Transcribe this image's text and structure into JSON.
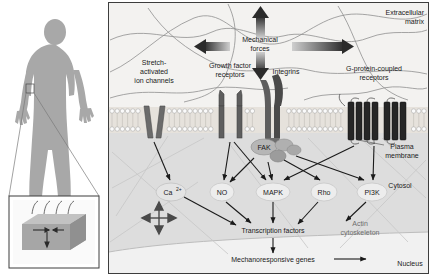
{
  "figure": {
    "panels": {
      "left": {
        "name": "human-body-panel",
        "body_figure_label": "human-silhouette",
        "inset_label": "tissue-block-inset"
      },
      "right": {
        "name": "cell-signalling-panel"
      }
    }
  },
  "compartments": [
    {
      "id": "extracellular",
      "label": "Extracellular\nmatrix",
      "line1": "Extracellular",
      "line2": "matrix",
      "color": "#f2f2f2"
    },
    {
      "id": "membrane",
      "label": "Plasma\nmembrane",
      "line1": "Plasma",
      "line2": "membrane",
      "color": "#e8e5e0"
    },
    {
      "id": "cytosol",
      "label": "Cytosol",
      "line1": "Cytosol",
      "line2": "",
      "color": "#dedede"
    },
    {
      "id": "nucleus",
      "label": "Nucleus",
      "line1": "Nucleus",
      "line2": "",
      "color": "#efefef"
    }
  ],
  "forces": {
    "label_line1": "Mechanical",
    "label_line2": "forces",
    "arrow_directions": [
      "up",
      "down",
      "left",
      "right"
    ]
  },
  "receptors": [
    {
      "id": "stretch-activated-ion-channels",
      "line1": "Stretch-",
      "line2": "activated",
      "line3": "ion channels"
    },
    {
      "id": "growth-factor-receptors",
      "line1": "Growth factor",
      "line2": "receptors",
      "line3": ""
    },
    {
      "id": "integrins",
      "line1": "Integrins",
      "line2": "",
      "line3": ""
    },
    {
      "id": "g-protein-coupled-receptors",
      "line1": "G-protein-coupled",
      "line2": "receptors",
      "line3": ""
    }
  ],
  "nodes": [
    {
      "id": "fak",
      "label": "FAK",
      "shape": "blob",
      "style": "membrane-complex"
    },
    {
      "id": "calcium",
      "label": "Ca",
      "sup": "2+",
      "shape": "ellipse"
    },
    {
      "id": "no",
      "label": "NO",
      "shape": "ellipse"
    },
    {
      "id": "mapk",
      "label": "MAPK",
      "shape": "ellipse"
    },
    {
      "id": "rho",
      "label": "Rho",
      "shape": "ellipse"
    },
    {
      "id": "pi3k",
      "label": "PI3K",
      "shape": "ellipse"
    },
    {
      "id": "transcription-factors",
      "label": "Transcription factors",
      "shape": "text"
    },
    {
      "id": "mechanoresponsive-genes",
      "label": "Mechanoresponsive genes",
      "shape": "text"
    },
    {
      "id": "actin-cytoskeleton",
      "line1": "Actin",
      "line2": "cytoskeleton",
      "shape": "text-gray"
    }
  ],
  "edges": [
    {
      "from": "stretch-activated-ion-channels",
      "to": "calcium"
    },
    {
      "from": "growth-factor-receptors",
      "to": "no"
    },
    {
      "from": "growth-factor-receptors",
      "to": "mapk"
    },
    {
      "from": "fak",
      "to": "no"
    },
    {
      "from": "fak",
      "to": "mapk"
    },
    {
      "from": "fak",
      "to": "rho"
    },
    {
      "from": "fak",
      "to": "pi3k"
    },
    {
      "from": "g-protein-coupled-receptors",
      "to": "mapk"
    },
    {
      "from": "g-protein-coupled-receptors",
      "to": "pi3k"
    },
    {
      "from": "calcium",
      "to": "transcription-factors"
    },
    {
      "from": "no",
      "to": "transcription-factors"
    },
    {
      "from": "mapk",
      "to": "transcription-factors"
    },
    {
      "from": "rho",
      "to": "actin-cytoskeleton"
    },
    {
      "from": "pi3k",
      "to": "transcription-factors"
    },
    {
      "from": "transcription-factors",
      "to": "mechanoresponsive-genes"
    },
    {
      "from": "mechanoresponsive-genes",
      "to": "nucleus"
    }
  ],
  "colors": {
    "body_fill": "#a8a8a8",
    "membrane_head": "#f7f7f7",
    "receptor_dark": "#5a5a5a",
    "gpcr_dark": "#2e2e2e",
    "arrow": "#1a1a1a",
    "ecm_fiber": "#8c8c8c",
    "panel_border": "#4a4a4a",
    "nucleus_fill": "#f4f4f4",
    "cytosol_fill": "#dcdcdc"
  }
}
